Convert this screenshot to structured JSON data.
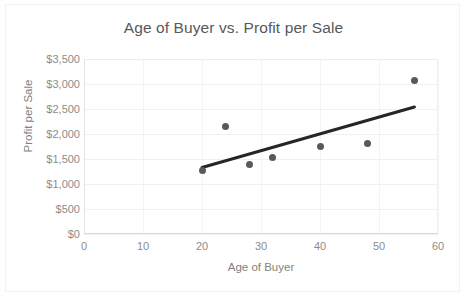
{
  "chart_data": {
    "type": "scatter",
    "title": "Age of Buyer vs. Profit per Sale",
    "xlabel": "Age of Buyer",
    "ylabel": "Profit per Sale",
    "xlim": [
      0,
      60
    ],
    "ylim": [
      0,
      3500
    ],
    "grid": true,
    "legend": false,
    "marker_color": "#595959",
    "trendline_color": "#262626",
    "xticks": [
      0,
      10,
      20,
      30,
      40,
      50,
      60
    ],
    "xtick_labels": [
      "0",
      "10",
      "20",
      "30",
      "40",
      "50",
      "60"
    ],
    "yticks": [
      0,
      500,
      1000,
      1500,
      2000,
      2500,
      3000,
      3500
    ],
    "ytick_labels": [
      "$0",
      "$500",
      "$1,000",
      "$1,500",
      "$2,000",
      "$2,500",
      "$3,000",
      "$3,500"
    ],
    "x": [
      20,
      24,
      28,
      32,
      40,
      48,
      56
    ],
    "y": [
      1270,
      2150,
      1390,
      1530,
      1760,
      1820,
      3080
    ],
    "points": [
      {
        "x": 20,
        "y": 1270
      },
      {
        "x": 24,
        "y": 2150
      },
      {
        "x": 28,
        "y": 1390
      },
      {
        "x": 32,
        "y": 1530
      },
      {
        "x": 40,
        "y": 1760
      },
      {
        "x": 48,
        "y": 1820
      },
      {
        "x": 56,
        "y": 3080
      }
    ],
    "trendline": {
      "type": "linear",
      "x0": 20,
      "y0": 1330,
      "x1": 56,
      "y1": 2540
    }
  }
}
